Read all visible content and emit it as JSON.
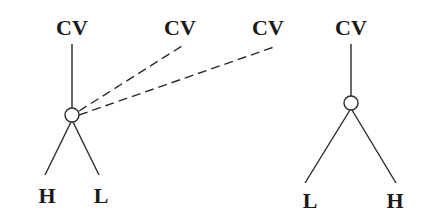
{
  "diagram": {
    "type": "autosegmental tone association",
    "colors": {
      "ink": "#1a1a1a",
      "background": "#ffffff"
    },
    "left_tree": {
      "top_label": "CV",
      "node": "tonal root node (circle)",
      "children": [
        "H",
        "L"
      ],
      "extra_links": [
        {
          "target_label": "CV",
          "style": "dashed"
        },
        {
          "target_label": "CV",
          "style": "dashed"
        }
      ]
    },
    "middle_labels": [
      "CV",
      "CV"
    ],
    "right_tree": {
      "top_label": "CV",
      "node": "tonal root node (circle)",
      "children": [
        "L",
        "H"
      ]
    }
  }
}
